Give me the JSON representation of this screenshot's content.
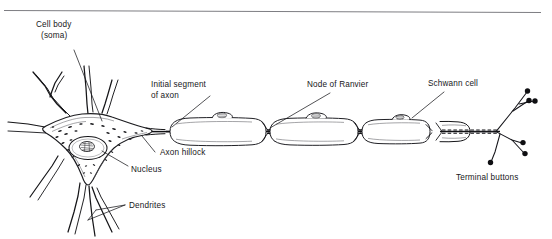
{
  "figure": {
    "background_color": "#ffffff",
    "ink_color": "#151518",
    "rule_color": "#6e6e74"
  },
  "labels": {
    "cell_body_line1": "Cell body",
    "cell_body_line2": "(soma)",
    "initial_segment_line1": "Initial segment",
    "initial_segment_line2": "of axon",
    "node_of_ranvier": "Node of Ranvier",
    "schwann_cell": "Schwann cell",
    "axon_hillock": "Axon hillock",
    "nucleus": "Nucleus",
    "dendrites": "Dendrites",
    "terminal_buttons": "Terminal buttons"
  },
  "structures": {
    "soma": "cell body with stippled cytoplasm",
    "nucleus": "oval nucleus with nucleolus",
    "dendrites_count": 5,
    "myelin_segments": 4,
    "nodes_of_ranvier": 3,
    "terminal_buttons_count": 6
  }
}
